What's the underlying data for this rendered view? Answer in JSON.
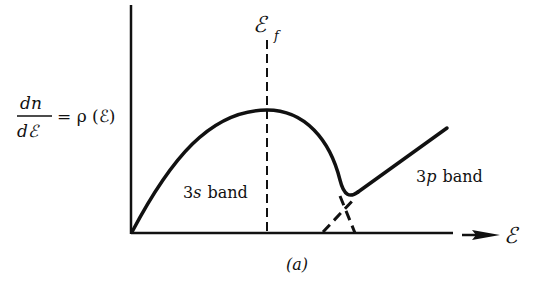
{
  "figure": {
    "ylabel_numerator": "dn",
    "ylabel_denominator": "dℰ",
    "ylabel_rhs": "= ρ (ℰ)",
    "fermi_label": "ℰ",
    "fermi_subscript": "f",
    "xlabel": "ℰ",
    "band_3s_label_num": "3",
    "band_3s_label_letter": "s",
    "band_3s_label_word": "band",
    "band_3p_label_num": "3",
    "band_3p_label_letter": "p",
    "band_3p_label_word": "band",
    "caption": "(a)",
    "line_color": "#111111"
  }
}
